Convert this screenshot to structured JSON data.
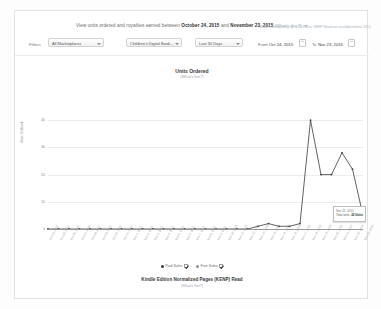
{
  "header": {
    "text_prefix": "View units ordered and royalties earned between",
    "date_start": "October 24, 2015",
    "text_mid": "and",
    "date_end": "November 23, 2015",
    "whats_this": "(What's this?)"
  },
  "filters": {
    "label": "Filters",
    "marketplace": "All Marketplaces",
    "book": "Children's Digital Book...",
    "period": "Last 30 Days",
    "from_label": "From",
    "from_value": "Oct 24, 2015",
    "to_label": "To",
    "to_value": "Nov 23, 2015",
    "note": "Data is delayed by up to 24 hours. KENP Read not available before 2015.",
    "calendar_icon": "calendar-icon"
  },
  "chart_data": {
    "type": "line",
    "title": "Units Ordered",
    "subtitle": "(What's this?)",
    "xlabel": "",
    "ylabel": "Units Ordered",
    "ylim": [
      0,
      50
    ],
    "yticks": [
      0,
      10,
      20,
      30,
      40
    ],
    "grid": true,
    "legend_position": "bottom",
    "x": [
      "Oct 24, 2015",
      "Oct 25, 2015",
      "Oct 26, 2015",
      "Oct 27, 2015",
      "Oct 28, 2015",
      "Oct 29, 2015",
      "Oct 30, 2015",
      "Oct 31, 2015",
      "Nov 1, 2015",
      "Nov 2, 2015",
      "Nov 3, 2015",
      "Nov 4, 2015",
      "Nov 5, 2015",
      "Nov 6, 2015",
      "Nov 7, 2015",
      "Nov 8, 2015",
      "Nov 9, 2015",
      "Nov 10, 2015",
      "Nov 11, 2015",
      "Nov 12, 2015",
      "Nov 13, 2015",
      "Nov 14, 2015",
      "Nov 15, 2015",
      "Nov 16, 2015",
      "Nov 17, 2015",
      "Nov 18, 2015",
      "Nov 19, 2015",
      "Nov 20, 2015",
      "Nov 21, 2015",
      "Nov 22, 2015",
      "Nov 23, 2015"
    ],
    "series": [
      {
        "name": "Paid Sales",
        "color": "#3b3b3b",
        "values": [
          0,
          0,
          0,
          0,
          0,
          0,
          0,
          0,
          0,
          0,
          0,
          0,
          0,
          0,
          0,
          0,
          0,
          0,
          0,
          0,
          1,
          2,
          1,
          1,
          2,
          40,
          20,
          20,
          28,
          22,
          5
        ]
      }
    ]
  },
  "tooltip": {
    "date": "Nov 22, 2015",
    "label": "Total units:",
    "value": "22 Units"
  },
  "legend": [
    {
      "label": "Paid Sales",
      "checked": true,
      "color": "#3b3b3b"
    },
    {
      "label": "Free Sales",
      "checked": true,
      "color": "#8e8e8e"
    }
  ],
  "footer_chart": {
    "title": "Kindle Edition Normalized Pages (KENP) Read",
    "subtitle": "(What's this?)"
  }
}
